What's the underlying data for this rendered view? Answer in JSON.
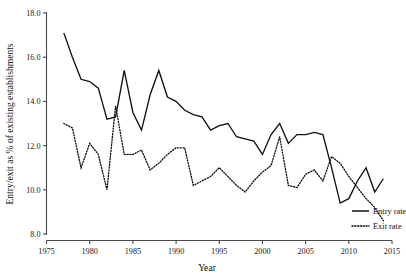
{
  "chart_data": {
    "type": "line",
    "title": "",
    "xlabel": "Year",
    "ylabel": "Entry/exit as % of existing establishments",
    "xlim": [
      1975,
      2015
    ],
    "ylim": [
      8.0,
      18.0
    ],
    "xticks": [
      1975,
      1980,
      1985,
      1990,
      1995,
      2000,
      2005,
      2010,
      2015
    ],
    "yticks": [
      8.0,
      10.0,
      12.0,
      14.0,
      16.0,
      18.0
    ],
    "xtick_labels": [
      "1975",
      "1980",
      "1985",
      "1990",
      "1995",
      "2000",
      "2005",
      "2010",
      "2015"
    ],
    "ytick_labels": [
      "8.0",
      "10.0",
      "12.0",
      "14.0",
      "16.0",
      "18.0"
    ],
    "grid": false,
    "legend_position": "right",
    "x": [
      1977,
      1978,
      1979,
      1980,
      1981,
      1982,
      1983,
      1984,
      1985,
      1986,
      1987,
      1988,
      1989,
      1990,
      1991,
      1992,
      1993,
      1994,
      1995,
      1996,
      1997,
      1998,
      1999,
      2000,
      2001,
      2002,
      2003,
      2004,
      2005,
      2006,
      2007,
      2008,
      2009,
      2010,
      2011,
      2012,
      2013,
      2014
    ],
    "series": [
      {
        "name": "Entry rate",
        "style": "solid",
        "values": [
          17.1,
          16.0,
          15.0,
          14.9,
          14.6,
          13.2,
          13.3,
          15.4,
          13.5,
          12.7,
          14.3,
          15.4,
          14.2,
          14.0,
          13.6,
          13.4,
          13.3,
          12.7,
          12.9,
          13.0,
          12.4,
          12.3,
          12.2,
          11.6,
          12.5,
          13.0,
          12.1,
          12.5,
          12.5,
          12.6,
          12.5,
          11.0,
          9.4,
          9.6,
          10.4,
          11.0,
          9.9,
          10.5
        ],
        "x_start": 1977
      },
      {
        "name": "Exit rate",
        "style": "dotted",
        "values": [
          13.0,
          12.8,
          11.0,
          12.1,
          11.6,
          10.0,
          13.8,
          11.6,
          11.6,
          11.8,
          10.9,
          11.2,
          11.6,
          11.9,
          11.9,
          10.2,
          10.4,
          10.6,
          11.0,
          10.6,
          10.2,
          9.9,
          10.4,
          10.8,
          11.1,
          12.4,
          10.2,
          10.1,
          10.7,
          10.9,
          10.4,
          11.5,
          11.2,
          10.6,
          10.1,
          9.6,
          9.2,
          8.6
        ],
        "x_start": 1977
      }
    ],
    "legend": [
      {
        "label": "Entry rate",
        "style": "solid"
      },
      {
        "label": "Exit rate",
        "style": "dotted"
      }
    ]
  }
}
